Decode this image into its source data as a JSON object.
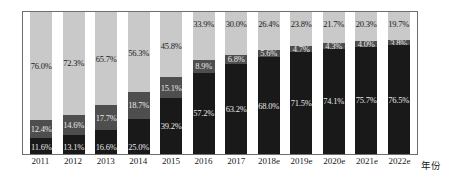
{
  "chart_data": {
    "type": "bar",
    "variant": "stacked-100-percent",
    "title": "",
    "subtitle": "",
    "xlabel": "年份",
    "ylabel": "",
    "ylim": [
      0,
      100
    ],
    "grid": false,
    "legend": "none",
    "categories": [
      "2011",
      "2012",
      "2013",
      "2014",
      "2015",
      "2016",
      "2017",
      "2018e",
      "2019e",
      "2020e",
      "2021e",
      "2022e"
    ],
    "series": [
      {
        "name": "top-segment",
        "color": "#c9c9c9",
        "values": [
          76.0,
          72.3,
          65.7,
          56.3,
          45.8,
          33.9,
          30.0,
          26.4,
          23.8,
          21.7,
          20.3,
          19.7
        ],
        "labels": [
          "76.0%",
          "72.3%",
          "65.7%",
          "56.3%",
          "45.8%",
          "33.9%",
          "30.0%",
          "26.4%",
          "23.8%",
          "21.7%",
          "20.3%",
          "19.7%"
        ]
      },
      {
        "name": "middle-segment",
        "color": "#4e4e4e",
        "values": [
          12.4,
          14.6,
          17.7,
          18.7,
          15.1,
          8.9,
          6.8,
          5.6,
          4.7,
          4.3,
          4.0,
          3.8
        ],
        "labels": [
          "12.4%",
          "14.6%",
          "17.7%",
          "18.7%",
          "15.1%",
          "8.9%",
          "6.8%",
          "5.6%",
          "4.7%",
          "4.3%",
          "4.0%",
          "3.8%"
        ]
      },
      {
        "name": "bottom-segment",
        "color": "#191919",
        "values": [
          11.6,
          13.1,
          16.6,
          25.0,
          39.2,
          57.2,
          63.2,
          68.0,
          71.5,
          74.1,
          75.7,
          76.5
        ],
        "labels": [
          "11.6%",
          "13.1%",
          "16.6%",
          "25.0%",
          "39.2%",
          "57.2%",
          "63.2%",
          "68.0%",
          "71.5%",
          "74.1%",
          "75.7%",
          "76.5%"
        ]
      }
    ]
  },
  "axis": {
    "x_title": "年份"
  }
}
